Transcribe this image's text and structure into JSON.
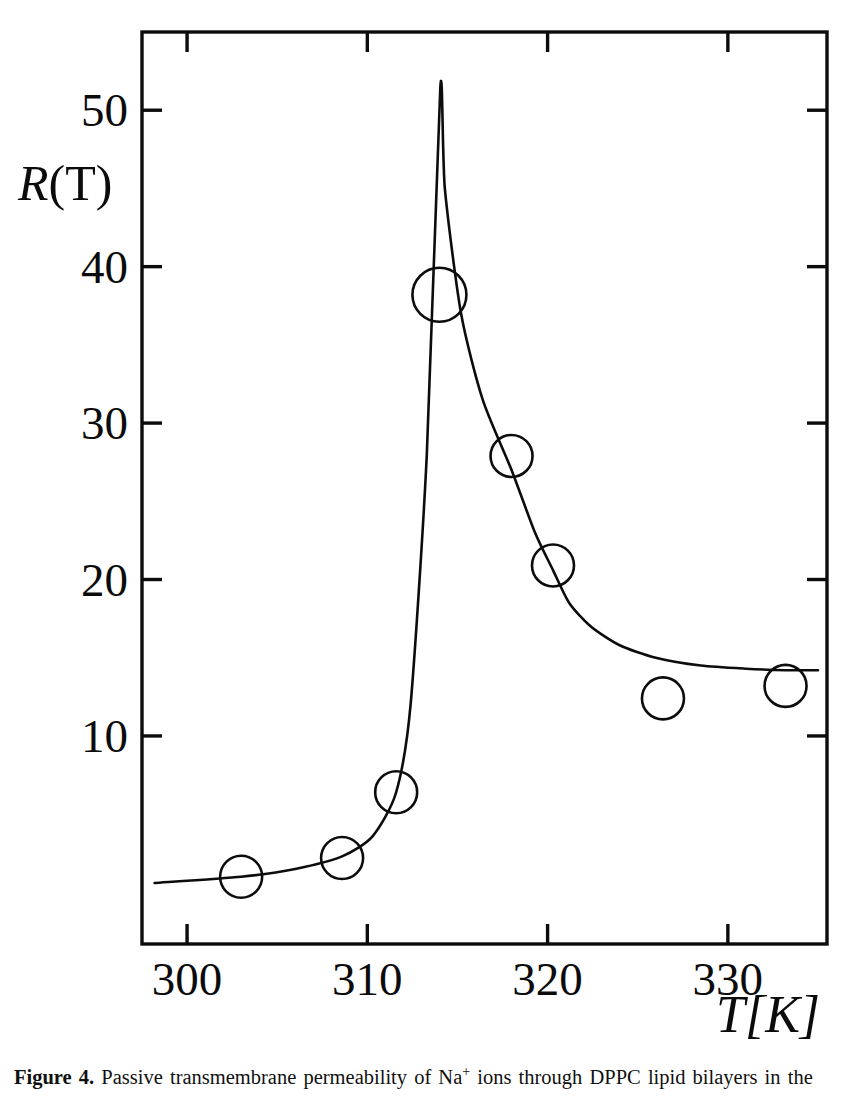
{
  "figure": {
    "caption_lead": "Figure 4.",
    "caption_text": " Passive transmembrane permeability of Na",
    "caption_sup": "+",
    "caption_tail": " ions through DPPC lipid bilayers in the"
  },
  "axes": {
    "y_title_var": "R",
    "y_title_rest": "(T)",
    "x_title": "T[K]",
    "x_title_main": "T",
    "x_title_unit": "[K]"
  },
  "ticks": {
    "y": [
      "10",
      "20",
      "30",
      "40",
      "50"
    ],
    "x": [
      "300",
      "310",
      "320",
      "330"
    ]
  },
  "chart_data": {
    "type": "scatter",
    "title": "Passive transmembrane permeability of Na+ ions through DPPC lipid bilayers",
    "xlabel": "T[K]",
    "ylabel": "R(T)",
    "xlim": [
      297.5,
      335.5
    ],
    "ylim": [
      -3.3,
      55.0
    ],
    "grid": false,
    "legend": null,
    "xticks": [
      300,
      310,
      320,
      330
    ],
    "yticks": [
      10,
      20,
      30,
      40,
      50
    ],
    "marker": "open-circle",
    "series": [
      {
        "name": "measured points",
        "kind": "scatter",
        "x": [
          303.0,
          308.6,
          311.6,
          314.0,
          318.0,
          320.3,
          326.4,
          333.2
        ],
        "y": [
          1.0,
          2.2,
          6.4,
          38.2,
          27.9,
          20.9,
          12.4,
          13.2
        ]
      },
      {
        "name": "fitted curve",
        "kind": "line",
        "x": [
          298.2,
          303.0,
          306.0,
          308.6,
          310.3,
          311.6,
          312.4,
          313.3,
          314.05,
          314.3,
          315.2,
          316.4,
          318.0,
          319.3,
          320.3,
          321.2,
          322.4,
          324.0,
          326.0,
          328.5,
          331.0,
          333.2,
          335.0
        ],
        "y": [
          0.6,
          1.0,
          1.5,
          2.3,
          3.6,
          6.4,
          12.0,
          28.0,
          51.5,
          45.0,
          37.0,
          31.5,
          27.0,
          23.0,
          20.6,
          18.5,
          17.0,
          15.8,
          15.0,
          14.5,
          14.3,
          14.2,
          14.2
        ]
      }
    ]
  }
}
